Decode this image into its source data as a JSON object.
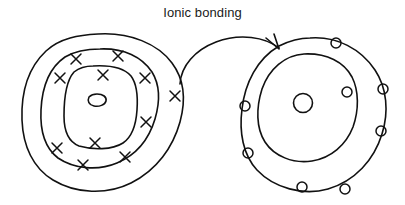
{
  "title": {
    "text": "Ionic bonding"
  },
  "colors": {
    "ink": "#111111",
    "background": "#ffffff"
  },
  "diagram": {
    "type": "hand-drawn-chemistry-sketch",
    "stroke_color": "#111111",
    "stroke_width": 1.6,
    "left_atom": {
      "name": "donor-atom",
      "nucleus": {
        "shape": "small-irregular-oval",
        "cx": 97,
        "cy": 100,
        "rx": 9,
        "ry": 6
      },
      "shell_count": 3,
      "electron_symbol": "x",
      "shells": [
        {
          "index": 1,
          "label": "inner-shell",
          "shape": "rounded-square",
          "electron_count": 0
        },
        {
          "index": 2,
          "label": "middle-shell",
          "shape": "rounded-oval",
          "electron_count": 8,
          "electrons": [
            {
              "cx": 76,
              "cy": 59,
              "angle": -125
            },
            {
              "cx": 118,
              "cy": 56,
              "angle": -60
            },
            {
              "cx": 60,
              "cy": 78,
              "angle": -155
            },
            {
              "cx": 103,
              "cy": 75,
              "angle": -80
            },
            {
              "cx": 145,
              "cy": 78,
              "angle": -25
            },
            {
              "cx": 146,
              "cy": 122,
              "angle": 25
            },
            {
              "cx": 57,
              "cy": 148,
              "angle": 160
            },
            {
              "cx": 95,
              "cy": 143,
              "angle": 95
            },
            {
              "cx": 125,
              "cy": 157,
              "angle": 55
            },
            {
              "cx": 83,
              "cy": 165,
              "angle": 110
            }
          ]
        },
        {
          "index": 3,
          "label": "outer-shell",
          "shape": "rounded-oval",
          "electron_count": 1,
          "electrons": [
            {
              "cx": 175,
              "cy": 96,
              "angle": 0
            }
          ]
        }
      ]
    },
    "right_atom": {
      "name": "acceptor-atom",
      "nucleus": {
        "shape": "small-circle",
        "cx": 303,
        "cy": 103,
        "rx": 9,
        "ry": 9
      },
      "shell_count": 2,
      "electron_symbol": "o",
      "shells": [
        {
          "index": 1,
          "label": "inner-shell",
          "shape": "rounded-oval",
          "electron_count": 0
        },
        {
          "index": 2,
          "label": "outer-shell",
          "shape": "rounded-oval",
          "electron_count": 8,
          "electrons": [
            {
              "cx": 336,
              "cy": 43,
              "angle": -75
            },
            {
              "cx": 383,
              "cy": 89,
              "angle": -15
            },
            {
              "cx": 381,
              "cy": 131,
              "angle": 25
            },
            {
              "cx": 345,
              "cy": 189,
              "angle": 75
            },
            {
              "cx": 302,
              "cy": 187,
              "angle": 100
            },
            {
              "cx": 248,
              "cy": 153,
              "angle": 150
            },
            {
              "cx": 245,
              "cy": 106,
              "angle": 185
            },
            {
              "cx": 347,
              "cy": 92,
              "angle": -10
            }
          ]
        }
      ]
    },
    "arrow": {
      "name": "electron-transfer-arrow",
      "direction": "left-to-right",
      "start": {
        "x": 180,
        "y": 84
      },
      "end": {
        "x": 279,
        "y": 48
      },
      "curvature": "arc-over-top",
      "arrowhead": "open-v"
    }
  }
}
